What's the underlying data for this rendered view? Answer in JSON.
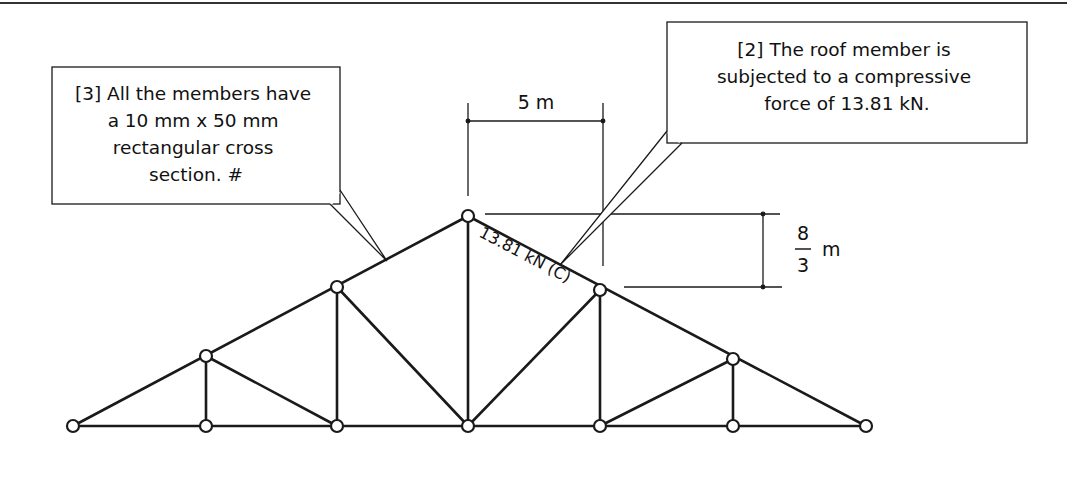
{
  "figure": {
    "type": "roof-truss",
    "colors": {
      "line": "#1a1a1a",
      "background": "#ffffff"
    }
  },
  "callouts": [
    {
      "id": "3",
      "lines": [
        "[3] All the members have",
        "a 10 mm x 50 mm",
        "rectangular cross",
        "section. #"
      ]
    },
    {
      "id": "2",
      "lines": [
        "[2] The roof member is",
        "subjected to a compressive",
        "force of 13.81 kN."
      ]
    }
  ],
  "dimensions": {
    "horizontal": {
      "label": "5 m"
    },
    "vertical": {
      "numerator": "8",
      "denominator": "3",
      "unit": "m"
    }
  },
  "member_label": "13.81 kN (C)"
}
